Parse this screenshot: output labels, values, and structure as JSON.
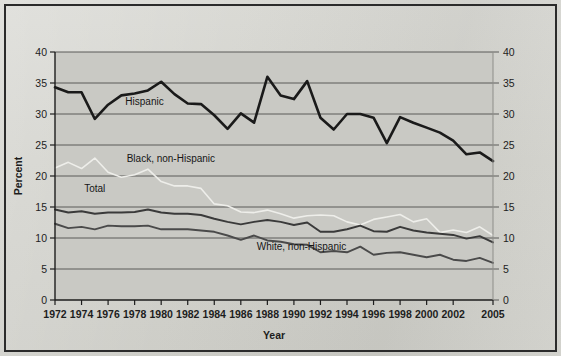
{
  "figure": {
    "background_color": "#d2d2cd",
    "plot_background_color": "#c9c9c4",
    "frame_color": "#2b2b2b",
    "gridline_color": "#5a5a58",
    "axis_color": "#1d1d1d"
  },
  "axes": {
    "y_label": "Percent",
    "x_label": "Year",
    "y_ticks": [
      "0",
      "5",
      "10",
      "15",
      "20",
      "25",
      "30",
      "35",
      "40"
    ],
    "y_ticks_right": [
      "0",
      "5",
      "10",
      "15",
      "20",
      "25",
      "30",
      "35",
      "40"
    ],
    "x_ticks": [
      "1972",
      "1974",
      "1976",
      "1978",
      "1980",
      "1982",
      "1984",
      "1986",
      "1988",
      "1990",
      "1992",
      "1994",
      "1996",
      "1998",
      "2000",
      "2002",
      "2005"
    ]
  },
  "series_labels": {
    "hispanic": "Hispanic",
    "black": "Black, non-Hispanic",
    "total": "Total",
    "white": "White, non-Hispanic"
  },
  "chart_data": {
    "type": "line",
    "title": "",
    "xlabel": "Year",
    "ylabel": "Percent",
    "xlim": [
      1972,
      2005
    ],
    "ylim": [
      0,
      40
    ],
    "grid": true,
    "legend": "inline-annotations",
    "x": [
      1972,
      1973,
      1974,
      1975,
      1976,
      1977,
      1978,
      1979,
      1980,
      1981,
      1982,
      1983,
      1984,
      1985,
      1986,
      1987,
      1988,
      1989,
      1990,
      1991,
      1992,
      1993,
      1994,
      1995,
      1996,
      1997,
      1998,
      1999,
      2000,
      2001,
      2002,
      2003,
      2004,
      2005
    ],
    "series": [
      {
        "name": "Hispanic",
        "color": "#1a1a1a",
        "width": 2.6,
        "values": [
          34.3,
          33.5,
          33.5,
          29.2,
          31.5,
          33.0,
          33.3,
          33.8,
          35.2,
          33.2,
          31.7,
          31.6,
          29.8,
          27.6,
          30.1,
          28.6,
          36.0,
          33.0,
          32.4,
          35.3,
          29.4,
          27.5,
          30.0,
          30.0,
          29.4,
          25.3,
          29.5,
          28.6,
          27.8,
          27.0,
          25.7,
          23.5,
          23.8,
          22.4
        ]
      },
      {
        "name": "Black, non-Hispanic",
        "color": "#eeeeea",
        "width": 1.6,
        "values": [
          21.3,
          22.2,
          21.2,
          22.9,
          20.6,
          19.8,
          20.2,
          21.1,
          19.1,
          18.4,
          18.4,
          18.0,
          15.5,
          15.2,
          14.2,
          14.1,
          14.5,
          13.9,
          13.2,
          13.6,
          13.7,
          13.6,
          12.6,
          12.1,
          13.0,
          13.4,
          13.8,
          12.6,
          13.1,
          10.9,
          11.3,
          10.9,
          11.8,
          10.4
        ]
      },
      {
        "name": "Total",
        "color": "#3a3a3a",
        "width": 2.0,
        "values": [
          14.6,
          14.1,
          14.3,
          13.9,
          14.1,
          14.1,
          14.2,
          14.6,
          14.1,
          13.9,
          13.9,
          13.7,
          13.1,
          12.6,
          12.2,
          12.6,
          12.9,
          12.6,
          12.1,
          12.5,
          11.0,
          11.0,
          11.4,
          12.0,
          11.1,
          11.0,
          11.8,
          11.2,
          10.9,
          10.7,
          10.5,
          9.9,
          10.3,
          9.3
        ]
      },
      {
        "name": "White, non-Hispanic",
        "color": "#4a4a4a",
        "width": 1.9,
        "values": [
          12.3,
          11.6,
          11.8,
          11.4,
          12.0,
          11.9,
          11.9,
          12.0,
          11.4,
          11.4,
          11.4,
          11.2,
          11.0,
          10.4,
          9.7,
          10.4,
          9.6,
          9.4,
          9.0,
          8.9,
          7.7,
          7.9,
          7.7,
          8.6,
          7.3,
          7.6,
          7.7,
          7.3,
          6.9,
          7.3,
          6.5,
          6.3,
          6.8,
          6.0
        ]
      }
    ]
  },
  "annotations": [
    {
      "id": "hispanic",
      "text": "Hispanic",
      "x": 1977.3,
      "y": 31.5
    },
    {
      "id": "black",
      "text": "Black, non-Hispanic",
      "x": 1977.4,
      "y": 22.2
    },
    {
      "id": "total",
      "text": "Total",
      "x": 1974.2,
      "y": 17.4
    },
    {
      "id": "white",
      "text": "White, non-Hispanic",
      "x": 1987.2,
      "y": 8.1
    }
  ]
}
